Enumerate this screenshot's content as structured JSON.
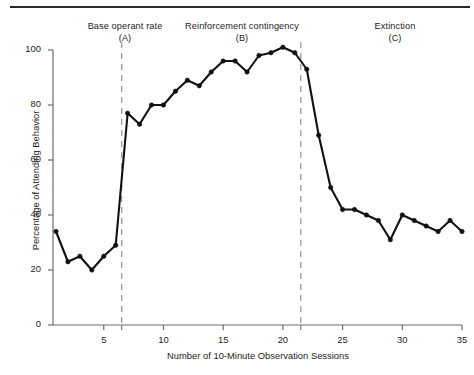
{
  "figure": {
    "has_top_rule": true,
    "line_color": "#111111",
    "axis_color": "#6e6e6e",
    "phase_line_color": "#9a9a9a"
  },
  "phases": [
    {
      "name": "Base operant rate",
      "letter": "(A)"
    },
    {
      "name": "Reinforcement contingency",
      "letter": "(B)"
    },
    {
      "name": "Extinction",
      "letter": "(C)"
    }
  ],
  "chart_data": {
    "type": "line",
    "title": "",
    "xlabel": "Number of 10-Minute Observation Sessions",
    "ylabel": "Percentage of Attending Behavior",
    "xlim": [
      1,
      35
    ],
    "ylim": [
      0,
      100
    ],
    "xticks": [
      5,
      10,
      15,
      20,
      25,
      30,
      35
    ],
    "yticks": [
      0,
      20,
      40,
      60,
      80,
      100
    ],
    "xtick_labels": [
      "5",
      "10",
      "15",
      "20",
      "25",
      "30",
      "35"
    ],
    "ytick_labels": [
      "0",
      "20",
      "40",
      "60",
      "80",
      "100"
    ],
    "grid": false,
    "legend": "none",
    "marker": "filled-circle",
    "x": [
      1,
      2,
      3,
      4,
      5,
      6,
      7,
      8,
      9,
      10,
      11,
      12,
      13,
      14,
      15,
      16,
      17,
      18,
      19,
      20,
      21,
      22,
      23,
      24,
      25,
      26,
      27,
      28,
      29,
      30,
      31,
      32,
      33,
      34,
      35
    ],
    "values": [
      34,
      23,
      25,
      20,
      25,
      29,
      77,
      73,
      80,
      80,
      85,
      89,
      87,
      92,
      96,
      96,
      92,
      98,
      99,
      101,
      99,
      93,
      69,
      50,
      42,
      42,
      40,
      38,
      31,
      40,
      38,
      36,
      34,
      38,
      34
    ],
    "annotations": [
      {
        "type": "phase-line",
        "x": 6.5,
        "style": "dashed"
      },
      {
        "type": "phase-line",
        "x": 21.5,
        "style": "dashed"
      }
    ],
    "phase_spans": [
      {
        "label": "Base operant rate (A)",
        "x_start": 1,
        "x_end": 6.5
      },
      {
        "label": "Reinforcement contingency (B)",
        "x_start": 6.5,
        "x_end": 21.5
      },
      {
        "label": "Extinction (C)",
        "x_start": 21.5,
        "x_end": 35
      }
    ]
  }
}
